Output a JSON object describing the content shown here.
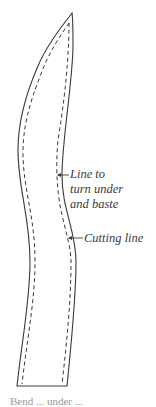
{
  "diagram": {
    "labels": {
      "turn_under": [
        "Line to",
        "turn under",
        "and baste"
      ],
      "cutting": "Cutting line"
    },
    "caption_partial": "Bend ... under ... ",
    "colors": {
      "outline": "#3a3a3a",
      "dashed": "#3a3a3a",
      "text": "#3a3a3a",
      "background": "#ffffff"
    },
    "shape": {
      "outer_path": "M72,13 C64,24 48,42 38,66 C24,98 18,124 18,150 C18,190 30,215 30,262 C30,300 22,340 17,386 L67,386 C71,345 76,300 76,262 C76,230 62,210 62,175 C62,140 73,80 73,45 C73,30 73,20 72,13 Z",
      "inner_left_path": "M69,23 C60,36 48,54 41,74 C29,104 23,128 23,152 C23,190 35,215 35,262 C35,300 27,340 22,384",
      "inner_right_path": "M69,23 C69,40 68,80 58,140 C56,160 56,190 62,215 C68,240 71,250 71,262 C71,300 67,340 62,384"
    }
  }
}
